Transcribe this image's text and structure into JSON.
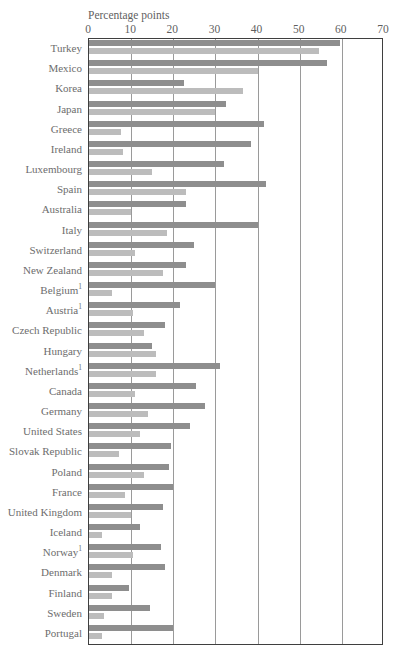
{
  "chart_data": {
    "type": "bar",
    "orientation": "horizontal",
    "title": "",
    "xlabel": "Percentage points",
    "ylabel": "",
    "xlim": [
      0,
      70
    ],
    "xticks": [
      0,
      10,
      20,
      30,
      40,
      50,
      60,
      70
    ],
    "grid": true,
    "legend_position": "none",
    "colors": {
      "series1": "#8e8e8e",
      "series2": "#bcbcbc"
    },
    "categories": [
      "Turkey",
      "Mexico",
      "Korea",
      "Japan",
      "Greece",
      "Ireland",
      "Luxembourg",
      "Spain",
      "Australia",
      "Italy",
      "Switzerland",
      "New Zealand",
      "Belgium",
      "Austria",
      "Czech Republic",
      "Hungary",
      "Netherlands",
      "Canada",
      "Germany",
      "United States",
      "Slovak Republic",
      "Poland",
      "France",
      "United Kingdom",
      "Iceland",
      "Norway",
      "Denmark",
      "Finland",
      "Sweden",
      "Portugal"
    ],
    "category_footnotes": {
      "Belgium": "1",
      "Austria": "1",
      "Netherlands": "1",
      "Norway": "1"
    },
    "series": [
      {
        "name": "series-1",
        "color": "#8e8e8e",
        "values": [
          59.5,
          56.5,
          22.5,
          32.5,
          41.5,
          38.5,
          32.0,
          42.0,
          23.0,
          40.0,
          25.0,
          23.0,
          30.0,
          21.5,
          18.0,
          15.0,
          31.0,
          25.5,
          27.5,
          24.0,
          19.5,
          19.0,
          20.0,
          17.5,
          12.0,
          17.0,
          18.0,
          9.5,
          14.5,
          20.0
        ]
      },
      {
        "name": "series-2",
        "color": "#bcbcbc",
        "values": [
          54.5,
          40.0,
          36.5,
          30.0,
          7.5,
          8.0,
          15.0,
          23.0,
          10.0,
          18.5,
          11.0,
          17.5,
          5.5,
          10.5,
          13.0,
          16.0,
          16.0,
          11.0,
          14.0,
          12.0,
          7.0,
          13.0,
          8.5,
          10.0,
          3.0,
          10.5,
          5.5,
          5.5,
          3.5,
          3.0
        ]
      }
    ]
  },
  "header": {
    "cutoff_line": ""
  }
}
